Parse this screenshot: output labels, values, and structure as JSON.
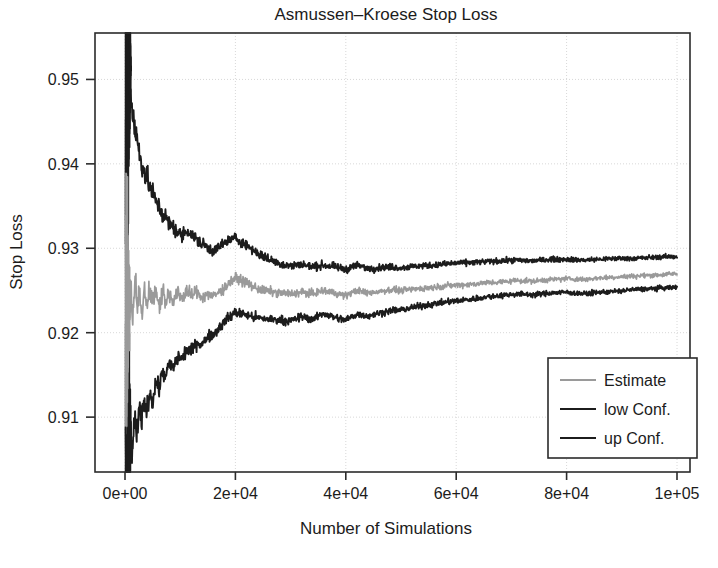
{
  "chart_data": {
    "type": "line",
    "title": "Asmussen–Kroese Stop Loss",
    "xlabel": "Number of Simulations",
    "ylabel": "Stop Loss",
    "xlim": [
      0,
      100000
    ],
    "ylim": [
      0.9035,
      0.9555
    ],
    "grid": true,
    "legend_position": "bottom-right",
    "xticks": [
      0,
      20000,
      40000,
      60000,
      80000,
      100000
    ],
    "xtick_labels": [
      "0e+00",
      "2e+04",
      "4e+04",
      "6e+04",
      "8e+04",
      "1e+05"
    ],
    "yticks": [
      0.91,
      0.92,
      0.93,
      0.94,
      0.95
    ],
    "ytick_labels": [
      "0.91",
      "0.92",
      "0.93",
      "0.94",
      "0.95"
    ],
    "series": [
      {
        "name": "Estimate",
        "color": "#9a9a9a",
        "width": 1.7,
        "x": [
          200,
          400,
          600,
          800,
          1000,
          1400,
          1800,
          2200,
          2600,
          3000,
          3500,
          4000,
          4500,
          5000,
          5600,
          6200,
          6800,
          7400,
          8000,
          8800,
          9600,
          10400,
          11200,
          12000,
          13000,
          14000,
          15000,
          16000,
          17000,
          18000,
          19000,
          20000,
          21500,
          23000,
          24500,
          26000,
          28000,
          30000,
          32000,
          34000,
          36000,
          38000,
          40000,
          42000,
          44000,
          46000,
          48000,
          50000,
          53000,
          56000,
          59000,
          62000,
          65000,
          68000,
          71000,
          74000,
          77000,
          80000,
          83000,
          86000,
          89000,
          92000,
          95000,
          98000,
          100000
        ],
        "y": [
          0.9238,
          0.9198,
          0.9272,
          0.9215,
          0.9258,
          0.9221,
          0.9265,
          0.9233,
          0.9259,
          0.9224,
          0.9256,
          0.923,
          0.9253,
          0.9235,
          0.9248,
          0.9231,
          0.9251,
          0.9238,
          0.9246,
          0.9234,
          0.9247,
          0.924,
          0.9251,
          0.9244,
          0.9249,
          0.9242,
          0.9246,
          0.9243,
          0.9248,
          0.9253,
          0.926,
          0.9265,
          0.9261,
          0.9255,
          0.9251,
          0.9249,
          0.9247,
          0.9246,
          0.9248,
          0.9246,
          0.925,
          0.9247,
          0.9244,
          0.925,
          0.9247,
          0.9249,
          0.9251,
          0.925,
          0.9252,
          0.9254,
          0.9256,
          0.9257,
          0.9259,
          0.926,
          0.9262,
          0.9261,
          0.9263,
          0.9264,
          0.9263,
          0.9265,
          0.9266,
          0.9267,
          0.9268,
          0.9269,
          0.927
        ]
      },
      {
        "name": "low Conf.",
        "color": "#1c1c1c",
        "width": 1.9,
        "x": [
          200,
          400,
          600,
          800,
          1000,
          1400,
          1800,
          2200,
          2600,
          3000,
          3500,
          4000,
          4500,
          5000,
          5600,
          6200,
          6800,
          7400,
          8000,
          8800,
          9600,
          10400,
          11200,
          12000,
          13000,
          14000,
          15000,
          16000,
          17000,
          18000,
          19000,
          20000,
          21500,
          23000,
          24500,
          26000,
          28000,
          30000,
          32000,
          34000,
          36000,
          38000,
          40000,
          42000,
          44000,
          46000,
          48000,
          50000,
          53000,
          56000,
          59000,
          62000,
          65000,
          68000,
          71000,
          74000,
          77000,
          80000,
          83000,
          86000,
          89000,
          92000,
          95000,
          98000,
          100000
        ],
        "y": [
          0.9042,
          0.9038,
          0.9065,
          0.9048,
          0.9076,
          0.9062,
          0.9095,
          0.9081,
          0.9108,
          0.9094,
          0.9119,
          0.9106,
          0.9131,
          0.9118,
          0.9142,
          0.9134,
          0.9155,
          0.9147,
          0.9163,
          0.9158,
          0.9172,
          0.9169,
          0.9181,
          0.9178,
          0.9189,
          0.9186,
          0.9196,
          0.9198,
          0.9206,
          0.9213,
          0.9219,
          0.9224,
          0.9222,
          0.9219,
          0.9217,
          0.9216,
          0.9215,
          0.9214,
          0.9219,
          0.9216,
          0.9223,
          0.9218,
          0.9215,
          0.9222,
          0.922,
          0.9223,
          0.9226,
          0.9227,
          0.9231,
          0.9234,
          0.9237,
          0.9239,
          0.9242,
          0.9244,
          0.9246,
          0.9245,
          0.9247,
          0.9248,
          0.9246,
          0.9248,
          0.9249,
          0.9251,
          0.9252,
          0.9253,
          0.9254
        ]
      },
      {
        "name": "up Conf.",
        "color": "#1c1c1c",
        "width": 1.9,
        "x": [
          200,
          400,
          600,
          800,
          1000,
          1400,
          1800,
          2200,
          2600,
          3000,
          3500,
          4000,
          4500,
          5000,
          5600,
          6200,
          6800,
          7400,
          8000,
          8800,
          9600,
          10400,
          11200,
          12000,
          13000,
          14000,
          15000,
          16000,
          17000,
          18000,
          19000,
          20000,
          21500,
          23000,
          24500,
          26000,
          28000,
          30000,
          32000,
          34000,
          36000,
          38000,
          40000,
          42000,
          44000,
          46000,
          48000,
          50000,
          53000,
          56000,
          59000,
          62000,
          65000,
          68000,
          71000,
          74000,
          77000,
          80000,
          83000,
          86000,
          89000,
          92000,
          95000,
          98000,
          100000
        ],
        "y": [
          0.9552,
          0.9548,
          0.952,
          0.9505,
          0.9478,
          0.9462,
          0.944,
          0.9428,
          0.9412,
          0.9403,
          0.939,
          0.9383,
          0.9372,
          0.9365,
          0.9356,
          0.9349,
          0.934,
          0.9336,
          0.9329,
          0.9325,
          0.9318,
          0.9315,
          0.9322,
          0.9316,
          0.931,
          0.9305,
          0.9301,
          0.9297,
          0.9301,
          0.9306,
          0.931,
          0.9312,
          0.9306,
          0.9299,
          0.9292,
          0.9287,
          0.9282,
          0.9279,
          0.9281,
          0.9278,
          0.928,
          0.9278,
          0.9275,
          0.928,
          0.9276,
          0.9277,
          0.9278,
          0.9277,
          0.9279,
          0.928,
          0.9282,
          0.9283,
          0.9284,
          0.9285,
          0.9286,
          0.9285,
          0.9287,
          0.9287,
          0.9286,
          0.9287,
          0.9288,
          0.9288,
          0.9289,
          0.929,
          0.929
        ]
      }
    ],
    "burn_in_note": "dense high-frequency noise band near x=0 spanning full y-range"
  },
  "legend": {
    "entries": [
      {
        "label": "Estimate",
        "color": "#9a9a9a"
      },
      {
        "label": "low Conf.",
        "color": "#1c1c1c"
      },
      {
        "label": "up Conf.",
        "color": "#1c1c1c"
      }
    ]
  },
  "colors": {
    "estimate": "#9a9a9a",
    "confidence": "#1c1c1c",
    "axis": "#2b2b2b",
    "grid": "#d8d8d8",
    "background": "#ffffff"
  }
}
